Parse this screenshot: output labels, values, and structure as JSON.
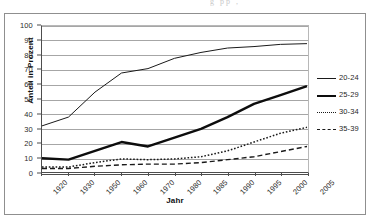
{
  "ghost_text": "g  pp   ,",
  "chart_data": {
    "type": "line",
    "title": "",
    "xlabel": "Jahr",
    "ylabel": "Anteil in Prozent",
    "ylim": [
      0,
      100
    ],
    "ytick_step": 10,
    "yticks": [
      0,
      10,
      20,
      30,
      40,
      50,
      60,
      70,
      80,
      90,
      100
    ],
    "grid": true,
    "legend_position": "right",
    "categories": [
      "1920",
      "1930",
      "1950",
      "1960",
      "1970",
      "1980",
      "1985",
      "1990",
      "1995",
      "2000",
      "2005"
    ],
    "series": [
      {
        "name": "20-24",
        "style": "solid-thin",
        "color": "#1a1a1a",
        "values": [
          32,
          38,
          55,
          68,
          71,
          78,
          82,
          85,
          86,
          87.5,
          88
        ]
      },
      {
        "name": "25-29",
        "style": "solid-thick",
        "color": "#0d0d0d",
        "values": [
          10,
          9,
          15,
          21,
          18,
          24,
          30,
          38,
          47,
          53,
          59
        ]
      },
      {
        "name": "30-34",
        "style": "dotted",
        "color": "#1a1a1a",
        "values": [
          4,
          4,
          7,
          9.5,
          9,
          9.5,
          11,
          15,
          21,
          27,
          31
        ]
      },
      {
        "name": "35-39",
        "style": "dashed",
        "color": "#1a1a1a",
        "values": [
          3,
          3,
          4.5,
          5.5,
          6,
          6,
          7,
          9,
          11,
          14.5,
          18
        ]
      }
    ]
  },
  "legend": {
    "items": [
      {
        "label": "20-24"
      },
      {
        "label": "25-29"
      },
      {
        "label": "30-34"
      },
      {
        "label": "35-39"
      }
    ]
  }
}
